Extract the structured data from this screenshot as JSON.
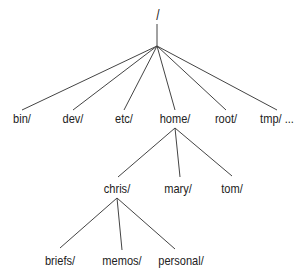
{
  "diagram": {
    "type": "tree",
    "colors": {
      "line": "#444444",
      "text": "#222222",
      "background": "#ffffff"
    },
    "root": {
      "label": "/"
    },
    "level1": [
      {
        "label": "bin/"
      },
      {
        "label": "dev/"
      },
      {
        "label": "etc/"
      },
      {
        "label": "home/"
      },
      {
        "label": "root/"
      },
      {
        "label": "tmp/ ..."
      }
    ],
    "home_children": [
      {
        "label": "chris/"
      },
      {
        "label": "mary/"
      },
      {
        "label": "tom/"
      }
    ],
    "chris_children": [
      {
        "label": "briefs/"
      },
      {
        "label": "memos/"
      },
      {
        "label": "personal/"
      }
    ]
  }
}
